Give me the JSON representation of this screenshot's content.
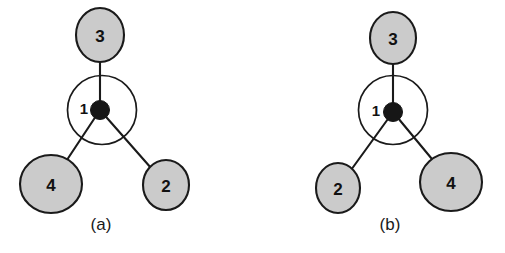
{
  "figure": {
    "width": 505,
    "height": 253,
    "background": "#ffffff"
  },
  "colors": {
    "node_fill_gray": "#cbcbcb",
    "node_stroke": "#1a1a1a",
    "center_ring_fill": "#ffffff",
    "center_dot": "#161616",
    "bond": "#141414",
    "text": "#111111",
    "caption_text": "#1a1a1a"
  },
  "panels": [
    {
      "id": "panel-a",
      "caption": "(a)",
      "caption_x": 101,
      "caption_y": 224,
      "center": {
        "label": "1",
        "label_x": 84,
        "label_y": 108,
        "dot_cx": 100,
        "dot_cy": 110,
        "dot_r": 9.5,
        "ring_cx": 102,
        "ring_cy": 110,
        "ring_r": 34.5
      },
      "nodes": [
        {
          "label": "3",
          "cx": 100,
          "cy": 35,
          "rx": 24,
          "ry": 27,
          "bond_width": 3.2
        },
        {
          "label": "4",
          "cx": 51,
          "cy": 184,
          "rx": 31,
          "ry": 29,
          "bond_width": 4.4
        },
        {
          "label": "2",
          "cx": 166,
          "cy": 185,
          "rx": 23,
          "ry": 25,
          "bond_width": 3.6
        }
      ]
    },
    {
      "id": "panel-b",
      "caption": "(b)",
      "caption_x": 390,
      "caption_y": 224,
      "center": {
        "label": "1",
        "label_x": 376,
        "label_y": 110,
        "dot_cx": 393,
        "dot_cy": 112,
        "dot_r": 9.5,
        "ring_cx": 393,
        "ring_cy": 110,
        "ring_r": 34.5
      },
      "nodes": [
        {
          "label": "3",
          "cx": 393,
          "cy": 38,
          "rx": 23,
          "ry": 26,
          "bond_width": 3.2
        },
        {
          "label": "2",
          "cx": 338,
          "cy": 188,
          "rx": 22,
          "ry": 25,
          "bond_width": 3.4
        },
        {
          "label": "4",
          "cx": 451,
          "cy": 182,
          "rx": 31,
          "ry": 29,
          "bond_width": 4.4
        }
      ]
    }
  ]
}
